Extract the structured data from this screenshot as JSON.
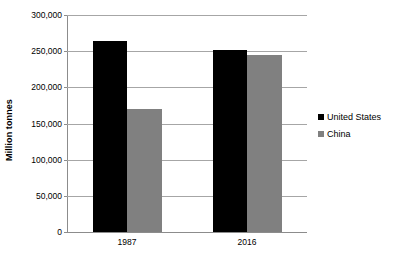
{
  "chart_data": {
    "type": "bar",
    "title": "",
    "xlabel": "",
    "ylabel": "Million tonnes",
    "categories": [
      "1987",
      "2016"
    ],
    "series": [
      {
        "name": "United States",
        "color": "#000000",
        "values": [
          264000,
          252000
        ]
      },
      {
        "name": "China",
        "color": "#808080",
        "values": [
          170000,
          245000
        ]
      }
    ],
    "ylim": [
      0,
      300000
    ],
    "yticks": [
      0,
      50000,
      100000,
      150000,
      200000,
      250000,
      300000
    ],
    "ytick_labels": [
      "0",
      "50,000",
      "100,000",
      "150,000",
      "200,000",
      "250,000",
      "300,000"
    ],
    "grid": true,
    "legend_position": "right"
  },
  "axes": {
    "y_title": "Million tonnes"
  },
  "legend": {
    "items": [
      {
        "label": "United States"
      },
      {
        "label": "China"
      }
    ]
  }
}
